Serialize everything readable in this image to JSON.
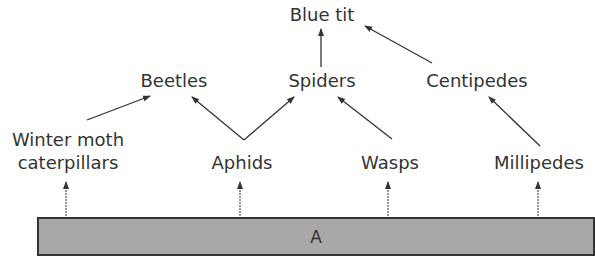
{
  "diagram": {
    "type": "food-web",
    "nodes": {
      "blue_tit": "Blue tit",
      "beetles": "Beetles",
      "spiders": "Spiders",
      "centipedes": "Centipedes",
      "winter_moth_line1": "Winter moth",
      "winter_moth_line2": "caterpillars",
      "aphids": "Aphids",
      "wasps": "Wasps",
      "millipedes": "Millipedes"
    },
    "base_label": "A",
    "edges": [
      {
        "from": "Winter moth caterpillars",
        "to": "Beetles"
      },
      {
        "from": "Aphids",
        "to": "Beetles"
      },
      {
        "from": "Aphids",
        "to": "Spiders"
      },
      {
        "from": "Wasps",
        "to": "Spiders"
      },
      {
        "from": "Spiders",
        "to": "Blue tit"
      },
      {
        "from": "Centipedes",
        "to": "Blue tit"
      },
      {
        "from": "Millipedes",
        "to": "Centipedes"
      },
      {
        "from": "A",
        "to": "Winter moth caterpillars"
      },
      {
        "from": "A",
        "to": "Aphids"
      },
      {
        "from": "A",
        "to": "Wasps"
      },
      {
        "from": "A",
        "to": "Millipedes"
      }
    ],
    "colors": {
      "text": "#333333",
      "box_fill": "#a8a8a8",
      "box_border": "#333333"
    }
  }
}
